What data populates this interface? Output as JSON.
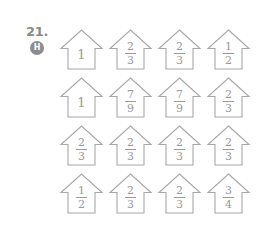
{
  "problem": {
    "number": "21.",
    "badge_label": "H",
    "badge_color": "#8d8d8d"
  },
  "style": {
    "line_color": "#a8a8a8",
    "text_color": "#9a9a9a",
    "background": "#ffffff"
  },
  "grid": {
    "columns": 4,
    "rows": 4,
    "shape": "house",
    "cells": [
      {
        "whole": "1"
      },
      {
        "numerator": "2",
        "denominator": "3"
      },
      {
        "numerator": "2",
        "denominator": "3"
      },
      {
        "numerator": "1",
        "denominator": "2"
      },
      {
        "whole": "1"
      },
      {
        "numerator": "7",
        "denominator": "9"
      },
      {
        "numerator": "7",
        "denominator": "9"
      },
      {
        "numerator": "2",
        "denominator": "3"
      },
      {
        "numerator": "2",
        "denominator": "3"
      },
      {
        "numerator": "2",
        "denominator": "3"
      },
      {
        "numerator": "2",
        "denominator": "3"
      },
      {
        "numerator": "2",
        "denominator": "3"
      },
      {
        "numerator": "1",
        "denominator": "2"
      },
      {
        "numerator": "2",
        "denominator": "3"
      },
      {
        "numerator": "2",
        "denominator": "3"
      },
      {
        "numerator": "3",
        "denominator": "4"
      }
    ]
  }
}
